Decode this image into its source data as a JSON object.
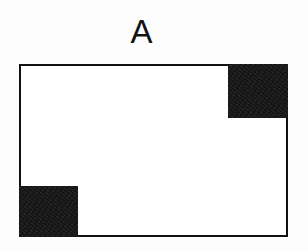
{
  "figure": {
    "label": "A",
    "domain_type": "diagram",
    "background_color": "#fdfdfd",
    "outline_color": "#111111",
    "fill_color": "#141414",
    "interior_color": "#ffffff",
    "outline_stroke_px": 2,
    "shapes": [
      {
        "name": "outer-rectangle",
        "kind": "rectangle",
        "style": "outlined",
        "x": 19,
        "y": 64,
        "width": 269,
        "height": 173
      },
      {
        "name": "corner-square-top-right",
        "kind": "square",
        "style": "filled",
        "corner": "top-right",
        "x": 228,
        "y": 64,
        "width": 60,
        "height": 54
      },
      {
        "name": "corner-square-bottom-left",
        "kind": "square",
        "style": "filled",
        "corner": "bottom-left",
        "x": 19,
        "y": 186,
        "width": 59,
        "height": 51
      }
    ]
  }
}
